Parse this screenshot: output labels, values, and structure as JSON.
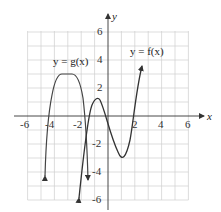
{
  "axes": {
    "x_label": "x",
    "y_label": "y",
    "x_ticks": [
      "-6",
      "-4",
      "-2",
      "2",
      "4",
      "6"
    ],
    "y_ticks": [
      "6",
      "4",
      "2",
      "-2",
      "-4",
      "-6"
    ],
    "range": {
      "x": [
        -6,
        6
      ],
      "y": [
        -6,
        6
      ]
    }
  },
  "curves": {
    "g": {
      "label": "y = g(x)",
      "color": "#333333"
    },
    "f": {
      "label": "y = f(x)",
      "color": "#333333"
    }
  },
  "colors": {
    "grid": "#cccccc",
    "axis": "#333333"
  }
}
